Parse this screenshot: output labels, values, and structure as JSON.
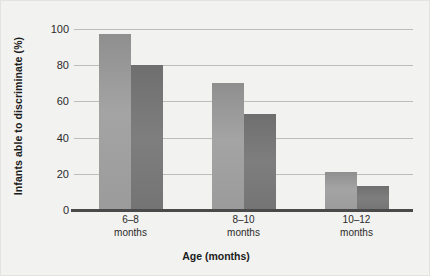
{
  "chart_data": {
    "type": "bar",
    "title": "",
    "xlabel": "Age (months)",
    "ylabel": "Infants able to discriminate (%)",
    "categories": [
      "6–8\nmonths",
      "8–10\nmonths",
      "10–12\nmonths"
    ],
    "category_lines": [
      {
        "line1": "6–8",
        "line2": "months"
      },
      {
        "line1": "8–10",
        "line2": "months"
      },
      {
        "line1": "10–12",
        "line2": "months"
      }
    ],
    "series": [
      {
        "name": "series-a",
        "values": [
          97,
          70,
          21
        ],
        "color": "#9b9b9b"
      },
      {
        "name": "series-b",
        "values": [
          80,
          53,
          13
        ],
        "color": "#757575"
      }
    ],
    "ylim": [
      0,
      100
    ],
    "yticks": [
      0,
      20,
      40,
      60,
      80,
      100
    ],
    "ytick_labels": [
      "0",
      "20",
      "40",
      "60",
      "80",
      "100"
    ],
    "grid": true,
    "legend": "none",
    "axis_color": "#4a4a4a",
    "grid_color": "#bdbdba",
    "background": "#f2f2f0"
  }
}
